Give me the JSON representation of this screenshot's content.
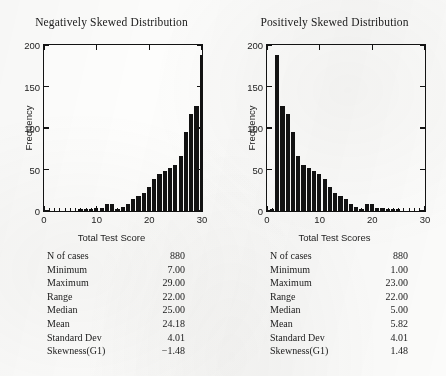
{
  "figure": {
    "y_axis_title": "Frequency",
    "y_ticks": [
      "0",
      "50",
      "100",
      "150",
      "200"
    ],
    "x_ticks": [
      "0",
      "10",
      "20",
      "30"
    ]
  },
  "chart_data": [
    {
      "type": "bar",
      "title": "Negatively Skewed Distribution",
      "xlabel": "Total Test Score",
      "ylabel": "Frequency",
      "xlim": [
        0,
        30
      ],
      "ylim": [
        0,
        200
      ],
      "grid": false,
      "x": [
        1,
        2,
        3,
        4,
        5,
        6,
        7,
        8,
        9,
        10,
        11,
        12,
        13,
        14,
        15,
        16,
        17,
        18,
        19,
        20,
        21,
        22,
        23,
        24,
        25,
        26,
        27,
        28,
        29,
        30
      ],
      "values": [
        0,
        0,
        0,
        0,
        0,
        0,
        2,
        3,
        3,
        4,
        4,
        8,
        8,
        3,
        5,
        8,
        14,
        18,
        22,
        29,
        38,
        45,
        48,
        52,
        55,
        66,
        95,
        117,
        126,
        188
      ],
      "tail_value": 2
    },
    {
      "type": "bar",
      "title": "Positively Skewed Distribution",
      "xlabel": "Total Test Scores",
      "ylabel": "Frequency",
      "xlim": [
        0,
        30
      ],
      "ylim": [
        0,
        200
      ],
      "grid": false,
      "x": [
        1,
        2,
        3,
        4,
        5,
        6,
        7,
        8,
        9,
        10,
        11,
        12,
        13,
        14,
        15,
        16,
        17,
        18,
        19,
        20,
        21,
        22,
        23,
        24,
        25,
        26,
        27,
        28,
        29,
        30
      ],
      "values": [
        2,
        188,
        126,
        117,
        95,
        66,
        55,
        52,
        48,
        45,
        38,
        29,
        22,
        18,
        14,
        8,
        5,
        3,
        8,
        8,
        4,
        4,
        3,
        3,
        2,
        0,
        0,
        0,
        0,
        0
      ],
      "tail_value": 0
    }
  ],
  "stats_left": {
    "rows": [
      {
        "label": "N of cases",
        "value": "880"
      },
      {
        "label": "Minimum",
        "value": "7.00"
      },
      {
        "label": "Maximum",
        "value": "29.00"
      },
      {
        "label": "Range",
        "value": "22.00"
      },
      {
        "label": "Median",
        "value": "25.00"
      },
      {
        "label": "Mean",
        "value": "24.18"
      },
      {
        "label": "Standard Dev",
        "value": "4.01"
      },
      {
        "label": "Skewness(G1)",
        "value": "−1.48"
      }
    ]
  },
  "stats_right": {
    "rows": [
      {
        "label": "N of cases",
        "value": "880"
      },
      {
        "label": "Minimum",
        "value": "1.00"
      },
      {
        "label": "Maximum",
        "value": "23.00"
      },
      {
        "label": "Range",
        "value": "22.00"
      },
      {
        "label": "Median",
        "value": "5.00"
      },
      {
        "label": "Mean",
        "value": "5.82"
      },
      {
        "label": "Standard Dev",
        "value": "4.01"
      },
      {
        "label": "Skewness(G1)",
        "value": "1.48"
      }
    ]
  }
}
